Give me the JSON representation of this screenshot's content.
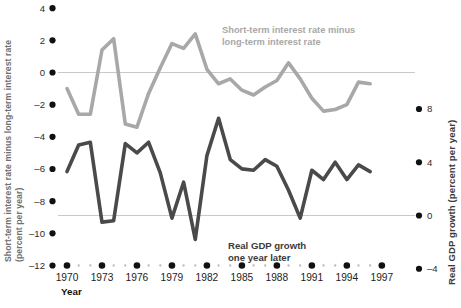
{
  "chart_data": {
    "type": "line",
    "title": "",
    "xlabel": "Year",
    "grid": false,
    "legend_position": "inline-annotations",
    "x": [
      1970,
      1971,
      1972,
      1973,
      1974,
      1975,
      1976,
      1977,
      1978,
      1979,
      1980,
      1981,
      1982,
      1983,
      1984,
      1985,
      1986,
      1987,
      1988,
      1989,
      1990,
      1991,
      1992,
      1993,
      1994,
      1995,
      1996
    ],
    "xlim": [
      1969,
      1997.5
    ],
    "xticks": [
      1970,
      1973,
      1976,
      1979,
      1982,
      1985,
      1988,
      1991,
      1994,
      1997
    ],
    "xtick_labels": [
      "1970",
      "1973",
      "1976",
      "1979",
      "1982",
      "1985",
      "1988",
      "1991",
      "1994",
      "1997"
    ],
    "left_axis": {
      "label": "Short-term interest rate minus long-term interest rate (percent per year)",
      "ticks": [
        4,
        2,
        0,
        -2,
        -4,
        -6,
        -8,
        -10,
        -12
      ],
      "tick_labels": [
        "4",
        "2",
        "0",
        "–2",
        "–4",
        "–6",
        "–8",
        "–10",
        "–12"
      ],
      "ylim": [
        -12,
        4
      ]
    },
    "right_axis": {
      "label": "Real GDP growth (percent per year)",
      "ticks": [
        8,
        4,
        0,
        -4
      ],
      "tick_labels": [
        "8",
        "4",
        "0",
        "–4"
      ],
      "ylim": [
        -4,
        9.2
      ]
    },
    "series": [
      {
        "name": "Short-term interest rate minus long-term interest rate",
        "axis": "left",
        "color": "#a8a8a8",
        "annotation_line1": "Short-term interest rate minus",
        "annotation_line2": "long-term interest rate",
        "values": [
          -1.0,
          -2.6,
          -2.6,
          1.4,
          2.1,
          -3.2,
          -3.4,
          -1.3,
          0.3,
          1.8,
          1.5,
          2.4,
          0.2,
          -0.7,
          -0.4,
          -1.1,
          -1.4,
          -0.9,
          -0.5,
          0.6,
          -0.4,
          -1.6,
          -2.4,
          -2.3,
          -2.0,
          -0.6,
          -0.7
        ]
      },
      {
        "name": "Real GDP growth one year later",
        "axis": "right",
        "color": "#4a4a4a",
        "annotation_line1": "Real GDP growth",
        "annotation_line2": "one year later",
        "values": [
          3.3,
          5.3,
          5.5,
          -0.5,
          -0.4,
          5.4,
          4.7,
          5.5,
          3.2,
          -0.2,
          2.5,
          -1.8,
          4.5,
          7.3,
          4.2,
          3.5,
          3.4,
          4.2,
          3.7,
          1.9,
          -0.2,
          3.4,
          2.7,
          4.0,
          2.7,
          3.8,
          3.3
        ]
      }
    ],
    "zero_line_left": 0,
    "zero_line_right": 0
  },
  "footnote": ""
}
